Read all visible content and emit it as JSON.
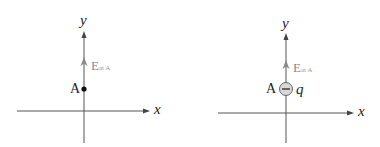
{
  "panels": [
    {
      "axes": {
        "x_label": "x",
        "y_label": "y"
      },
      "point": {
        "label": "A",
        "marker": "filled-dot"
      },
      "field_vector": {
        "symbol": "E",
        "subscript": "at A",
        "direction": "up"
      }
    },
    {
      "axes": {
        "x_label": "x",
        "y_label": "y"
      },
      "point": {
        "label": "A",
        "marker": "negative-charge"
      },
      "charge": {
        "label": "q",
        "sign": "−"
      },
      "field_vector": {
        "symbol": "E",
        "subscript": "at A",
        "direction": "up"
      }
    }
  ],
  "colors": {
    "axis": "#444444",
    "field": "#8a8a8a",
    "text": "#222222"
  }
}
